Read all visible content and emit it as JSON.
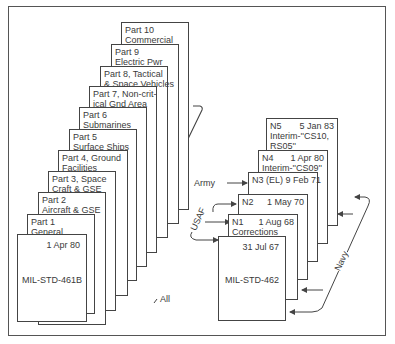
{
  "left_stack": {
    "parts": [
      {
        "line1": "Part 10",
        "line2": "Commercial"
      },
      {
        "line1": "Part 9",
        "line2": "Electric Pwr"
      },
      {
        "line1": "Part 8, Tactical",
        "line2": "& Space Vehicles"
      },
      {
        "line1": "Part 7, Non-crit-",
        "line2": "ical Gnd Area"
      },
      {
        "line1": "Part 6",
        "line2": "Submarines"
      },
      {
        "line1": "Part 5",
        "line2": "Surface Ships"
      },
      {
        "line1": "Part 4, Ground",
        "line2": "Facilities"
      },
      {
        "line1": "Part 3, Space",
        "line2": "Craft & GSE"
      },
      {
        "line1": "Part 2",
        "line2": "Aircraft & GSE"
      },
      {
        "line1": "Part 1",
        "line2": "General"
      }
    ],
    "base": {
      "date": "1 Apr 80",
      "name": "MIL-STD-461B"
    },
    "bracket_label": "All"
  },
  "right_stack": {
    "notices": [
      {
        "id": "N5",
        "date": "5 Jan 83",
        "line2": "Interim-''CS10,",
        "line3": "RS05''"
      },
      {
        "id": "N4",
        "date": "1 Apr 80",
        "line2": "Interim-''CS09''"
      },
      {
        "id": "N3 (EL)",
        "date": "9 Feb 71"
      },
      {
        "id": "N2",
        "date": "1 May 70"
      },
      {
        "id": "N1",
        "date": "1 Aug 68",
        "line2": "Corrections"
      }
    ],
    "base": {
      "date": "31 Jul 67",
      "name": "MIL-STD-462"
    },
    "labels": {
      "army": "Army",
      "usaf": "USAF",
      "navy": "Navy"
    }
  }
}
